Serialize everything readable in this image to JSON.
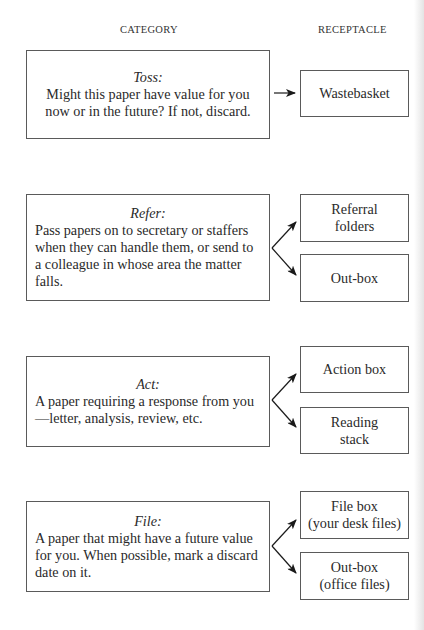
{
  "headers": {
    "category": "CATEGORY",
    "receptacle": "RECEPTACLE"
  },
  "categories": [
    {
      "title": "Toss:",
      "description": "Might this paper have value for you now or in the future? If not, discard.",
      "receptacles": [
        "Wastebasket"
      ]
    },
    {
      "title": "Refer:",
      "description": "Pass papers on to secretary or staffers when they can handle them, or send to a colleague in whose area the matter falls.",
      "receptacles": [
        "Referral folders",
        "Out-box"
      ]
    },
    {
      "title": "Act:",
      "description": "A paper requiring a response from you—letter, analysis, review, etc.",
      "receptacles": [
        "Action box",
        "Reading stack"
      ]
    },
    {
      "title": "File:",
      "description": "A paper that might have a future value for you. When possible, mark a discard date on it.",
      "receptacles": [
        "File box (your desk files)",
        "Out-box (office files)"
      ]
    }
  ],
  "receptacle_lines": {
    "referral_1": "Referral",
    "referral_2": "folders",
    "reading_1": "Reading",
    "reading_2": "stack",
    "filebox_1": "File box",
    "filebox_2": "(your desk files)",
    "outbox_office_1": "Out-box",
    "outbox_office_2": "(office files)"
  },
  "colors": {
    "line": "#5a5a5a",
    "text": "#2a2a2a",
    "arrow": "#1a1a1a"
  }
}
